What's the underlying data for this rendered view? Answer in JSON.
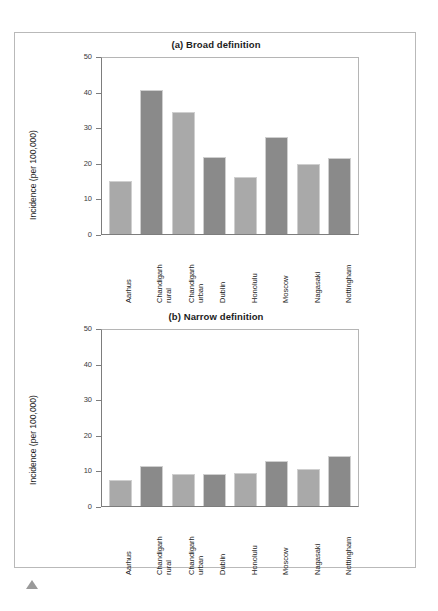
{
  "figure": {
    "marker_icon": "triangle-up-icon"
  },
  "chart_data": [
    {
      "type": "bar",
      "title": "(a) Broad definition",
      "xlabel": "",
      "ylabel": "Incidence (per 100,000)",
      "ylim": [
        0,
        50
      ],
      "yticks": [
        0,
        10,
        20,
        30,
        40,
        50
      ],
      "grid": false,
      "legend": "none",
      "categories": [
        "Aarhus",
        "Chandigarh\nrural",
        "Chandigarh\nurban",
        "Dublin",
        "Honolulu",
        "Moscow",
        "Nagasaki",
        "Nottingham"
      ],
      "values": [
        15.0,
        40.8,
        34.7,
        21.9,
        16.2,
        27.5,
        19.9,
        21.6
      ],
      "bar_colors": [
        "#a9a9a9",
        "#8a8a8a",
        "#a9a9a9",
        "#8a8a8a",
        "#a9a9a9",
        "#8a8a8a",
        "#a9a9a9",
        "#8a8a8a"
      ]
    },
    {
      "type": "bar",
      "title": "(b) Narrow definition",
      "xlabel": "",
      "ylabel": "Incidence (per 100,000)",
      "ylim": [
        0,
        50
      ],
      "yticks": [
        0,
        10,
        20,
        30,
        40,
        50
      ],
      "grid": false,
      "legend": "none",
      "categories": [
        "Aarhus",
        "Chandigarh\nrural",
        "Chandigarh\nurban",
        "Dublin",
        "Honolulu",
        "Moscow",
        "Nagasaki",
        "Nottingham"
      ],
      "values": [
        7.4,
        11.4,
        9.0,
        9.0,
        9.3,
        12.8,
        10.4,
        14.3
      ],
      "bar_colors": [
        "#a9a9a9",
        "#8a8a8a",
        "#a9a9a9",
        "#8a8a8a",
        "#a9a9a9",
        "#8a8a8a",
        "#a9a9a9",
        "#8a8a8a"
      ]
    }
  ]
}
